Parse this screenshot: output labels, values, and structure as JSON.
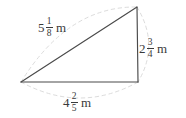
{
  "figure": {
    "name": "right-triangle-with-side-lengths",
    "shape": "right triangle",
    "unit": "m",
    "background_color": "#ffffff",
    "line_color": "#3a3a3a",
    "arc_color": "#d8d8d8",
    "vertices": {
      "left": [
        21,
        82
      ],
      "bottom_right": [
        138,
        82
      ],
      "top_right": [
        137,
        7
      ]
    },
    "sides": [
      {
        "id": "hypotenuse",
        "position": "upper-left",
        "whole": "5",
        "numerator": "1",
        "denominator": "8",
        "unit": "m",
        "value_text": "5 1/8 m"
      },
      {
        "id": "vertical",
        "position": "right",
        "whole": "2",
        "numerator": "3",
        "denominator": "4",
        "unit": "m",
        "value_text": "2 3/4 m"
      },
      {
        "id": "base",
        "position": "bottom",
        "whole": "4",
        "numerator": "2",
        "denominator": "5",
        "unit": "m",
        "value_text": "4 2/5 m"
      }
    ]
  }
}
